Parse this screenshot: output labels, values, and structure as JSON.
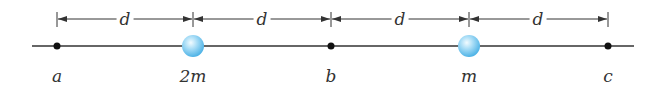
{
  "diagram": {
    "points": [
      {
        "id": "a",
        "label": "a",
        "x": 57,
        "type": "point"
      },
      {
        "id": "mass-2m",
        "label": "2m",
        "x": 193,
        "type": "sphere"
      },
      {
        "id": "b",
        "label": "b",
        "x": 331,
        "type": "point"
      },
      {
        "id": "mass-m",
        "label": "m",
        "x": 469,
        "type": "sphere"
      },
      {
        "id": "c",
        "label": "c",
        "x": 608,
        "type": "point"
      }
    ],
    "spacing_label": "d",
    "spacings": [
      {
        "label": "d",
        "x1": 57,
        "x2": 193
      },
      {
        "label": "d",
        "x1": 193,
        "x2": 331
      },
      {
        "label": "d",
        "x1": 331,
        "x2": 469
      },
      {
        "label": "d",
        "x1": 469,
        "x2": 608
      }
    ],
    "colors": {
      "line": "#333333",
      "sphere": "#7ccaf0",
      "sphere_highlight": "#e6f7ff"
    }
  }
}
